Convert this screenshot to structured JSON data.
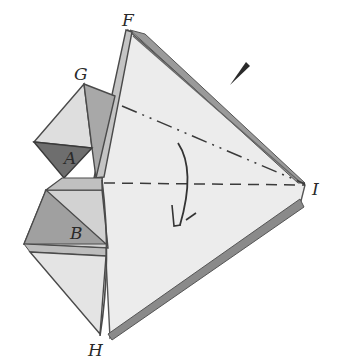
{
  "diagram": {
    "type": "origami-fold-step",
    "style": "pencil-shaded sketch",
    "labels": {
      "F": "F",
      "G": "G",
      "A": "A",
      "B": "B",
      "H": "H",
      "I": "I"
    },
    "fold_lines": [
      {
        "name": "valley-fold-H-I",
        "style": "dashed",
        "from": "center-left",
        "to": "I"
      },
      {
        "name": "mountain-fold-F-I",
        "style": "dash-dot",
        "from": "near-F",
        "to": "I"
      }
    ],
    "arrows": [
      {
        "name": "fold-arrow",
        "direction": "curved-down",
        "meaning": "fold flap down"
      },
      {
        "name": "pointer-mark",
        "direction": "diagonal",
        "meaning": "pencil wedge mark"
      }
    ],
    "colors": {
      "paper_light": "#ececec",
      "paper_mid": "#c8c8c8",
      "shade_dark": "#7a7a7a",
      "shade_medium": "#a4a4a4",
      "line": "#4a4a4a",
      "background": "#ffffff"
    }
  }
}
